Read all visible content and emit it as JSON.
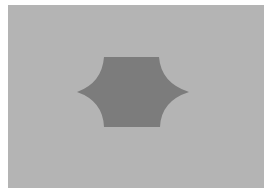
{
  "image": {
    "description": "Gray background with a dark gray hexagon-like shape with concave pointed left and right sides",
    "colors": {
      "page": "#ffffff",
      "background": "#b4b4b4",
      "shape": "#7c7c7c"
    }
  }
}
